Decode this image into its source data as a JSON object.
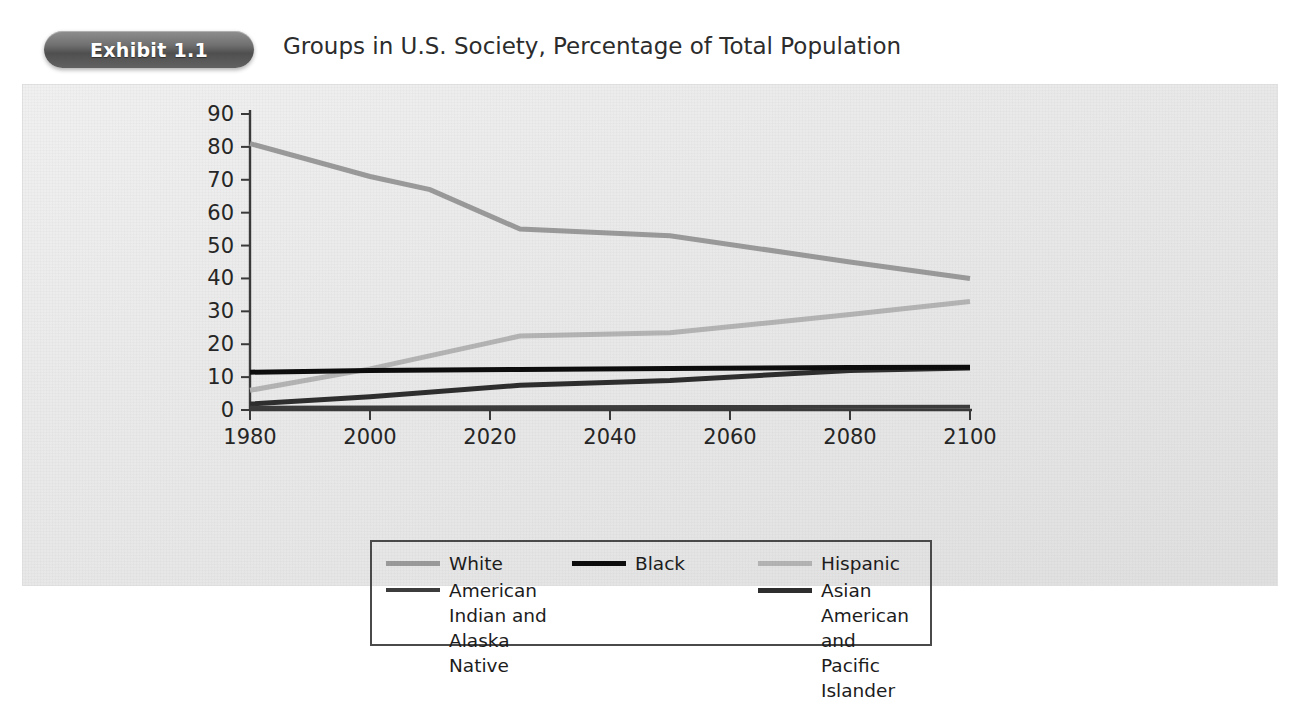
{
  "header": {
    "badge_label": "Exhibit 1.1",
    "title": "Groups in U.S. Society, Percentage of Total Population"
  },
  "chart_data": {
    "type": "line",
    "title": "Groups in U.S. Society, Percentage of Total Population",
    "xlabel": "",
    "ylabel": "",
    "xlim": [
      1980,
      2100
    ],
    "ylim": [
      0,
      90
    ],
    "xticks": [
      1980,
      2000,
      2020,
      2040,
      2060,
      2080,
      2100
    ],
    "yticks": [
      0,
      10,
      20,
      30,
      40,
      50,
      60,
      70,
      80,
      90
    ],
    "grid": false,
    "legend_position": "below",
    "series": [
      {
        "name": "White",
        "color": "#9a9a9a",
        "width": 5,
        "x": [
          1980,
          2000,
          2010,
          2025,
          2050,
          2080,
          2100
        ],
        "y": [
          81,
          71,
          67,
          55,
          53,
          45,
          40
        ]
      },
      {
        "name": "Black",
        "color": "#0d0d0d",
        "width": 5,
        "x": [
          1980,
          2000,
          2025,
          2050,
          2080,
          2100
        ],
        "y": [
          11.5,
          12,
          12.3,
          12.6,
          12.9,
          13
        ]
      },
      {
        "name": "Hispanic",
        "color": "#b4b4b4",
        "width": 5,
        "x": [
          1980,
          2000,
          2025,
          2050,
          2080,
          2100
        ],
        "y": [
          6,
          12.5,
          22.5,
          23.5,
          29,
          33
        ]
      },
      {
        "name": "American Indian and\nAlaska Native",
        "color": "#3c3c3c",
        "width": 4,
        "x": [
          1980,
          2000,
          2050,
          2100
        ],
        "y": [
          0.7,
          0.8,
          0.9,
          1.0
        ]
      },
      {
        "name": "Asian American and\nPacific Islander",
        "color": "#2e2e2e",
        "width": 5,
        "x": [
          1980,
          2000,
          2025,
          2050,
          2080,
          2100
        ],
        "y": [
          1.8,
          4,
          7.5,
          9,
          12,
          12.8
        ]
      }
    ],
    "legend_order": [
      "White",
      "Black",
      "Hispanic",
      "American Indian and\nAlaska Native",
      "Asian American and\nPacific Islander"
    ]
  }
}
